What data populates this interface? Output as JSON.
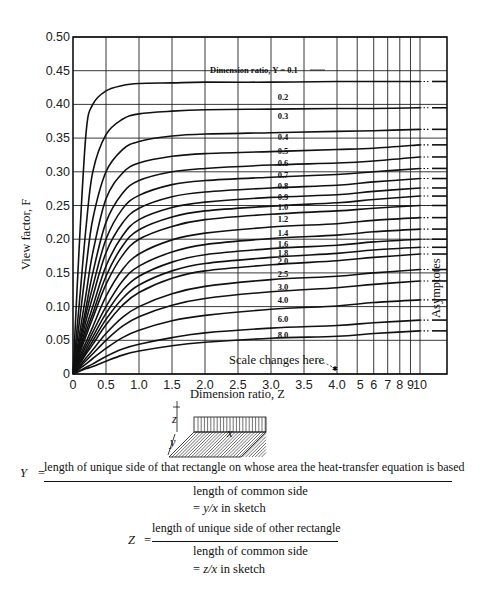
{
  "chart_data": {
    "type": "line",
    "title": "",
    "xlabel": "Dimension ratio, Z",
    "ylabel": "View factor, F",
    "ylim": [
      0,
      0.5
    ],
    "yticks": [
      "0",
      "0.05",
      "0.10",
      "0.15",
      "0.20",
      "0.25",
      "0.30",
      "0.35",
      "0.40",
      "0.45",
      "0.50"
    ],
    "xticks_linear": [
      "0",
      "0.5",
      "1.0",
      "1.5",
      "2.0",
      "2.5",
      "3.0",
      "3.5",
      "4.0"
    ],
    "xticks_log": [
      "5",
      "6",
      "7",
      "8",
      "9",
      "10"
    ],
    "grid": true,
    "legend_position": "inline labels",
    "legend_title": "Dimension ratio, Y = 0.1",
    "annotations": [
      "Scale changes here",
      "Asymptotes"
    ],
    "x": [
      0,
      0.1,
      0.2,
      0.3,
      0.5,
      0.75,
      1.0,
      1.5,
      2.0,
      3.0,
      4.0,
      6.0,
      10.0
    ],
    "series": [
      {
        "name": "0.1",
        "asymptote": 0.434,
        "values": [
          0,
          0.2,
          0.36,
          0.4,
          0.42,
          0.428,
          0.431,
          0.432,
          0.433,
          0.433,
          0.434,
          0.434,
          0.434
        ]
      },
      {
        "name": "0.2",
        "asymptote": 0.395,
        "values": [
          0,
          0.11,
          0.22,
          0.3,
          0.355,
          0.378,
          0.386,
          0.39,
          0.392,
          0.393,
          0.394,
          0.394,
          0.395
        ]
      },
      {
        "name": "0.3",
        "asymptote": 0.363,
        "values": [
          0,
          0.08,
          0.16,
          0.23,
          0.3,
          0.333,
          0.345,
          0.353,
          0.356,
          0.358,
          0.36,
          0.361,
          0.363
        ]
      },
      {
        "name": "0.4",
        "asymptote": 0.34,
        "values": [
          0,
          0.06,
          0.12,
          0.18,
          0.26,
          0.298,
          0.313,
          0.323,
          0.327,
          0.33,
          0.333,
          0.335,
          0.34
        ]
      },
      {
        "name": "0.5",
        "asymptote": 0.322,
        "values": [
          0,
          0.05,
          0.1,
          0.15,
          0.225,
          0.268,
          0.287,
          0.3,
          0.305,
          0.31,
          0.313,
          0.316,
          0.322
        ]
      },
      {
        "name": "0.6",
        "asymptote": 0.305,
        "values": [
          0,
          0.045,
          0.09,
          0.13,
          0.2,
          0.245,
          0.265,
          0.281,
          0.287,
          0.292,
          0.296,
          0.3,
          0.305
        ]
      },
      {
        "name": "0.7",
        "asymptote": 0.29,
        "values": [
          0,
          0.04,
          0.08,
          0.115,
          0.18,
          0.224,
          0.246,
          0.263,
          0.27,
          0.276,
          0.28,
          0.285,
          0.29
        ]
      },
      {
        "name": "0.8",
        "asymptote": 0.276,
        "values": [
          0,
          0.035,
          0.07,
          0.1,
          0.16,
          0.205,
          0.229,
          0.247,
          0.255,
          0.262,
          0.266,
          0.271,
          0.276
        ]
      },
      {
        "name": "0.9",
        "asymptote": 0.264,
        "values": [
          0,
          0.032,
          0.063,
          0.09,
          0.145,
          0.19,
          0.214,
          0.233,
          0.242,
          0.249,
          0.254,
          0.259,
          0.264
        ]
      },
      {
        "name": "1.0",
        "asymptote": 0.25,
        "values": [
          0,
          0.03,
          0.057,
          0.083,
          0.133,
          0.176,
          0.2,
          0.219,
          0.229,
          0.237,
          0.242,
          0.246,
          0.25
        ]
      },
      {
        "name": "1.2",
        "asymptote": 0.232,
        "values": [
          0,
          0.025,
          0.048,
          0.07,
          0.115,
          0.155,
          0.178,
          0.199,
          0.209,
          0.218,
          0.223,
          0.228,
          0.232
        ]
      },
      {
        "name": "1.4",
        "asymptote": 0.215,
        "values": [
          0,
          0.022,
          0.042,
          0.062,
          0.1,
          0.138,
          0.16,
          0.181,
          0.192,
          0.201,
          0.206,
          0.211,
          0.215
        ]
      },
      {
        "name": "1.6",
        "asymptote": 0.2,
        "values": [
          0,
          0.019,
          0.037,
          0.055,
          0.09,
          0.124,
          0.145,
          0.166,
          0.177,
          0.186,
          0.191,
          0.196,
          0.2
        ]
      },
      {
        "name": "1.8",
        "asymptote": 0.188,
        "values": [
          0,
          0.017,
          0.033,
          0.049,
          0.081,
          0.112,
          0.132,
          0.153,
          0.164,
          0.173,
          0.179,
          0.184,
          0.188
        ]
      },
      {
        "name": "2.0",
        "asymptote": 0.178,
        "values": [
          0,
          0.015,
          0.03,
          0.044,
          0.073,
          0.102,
          0.121,
          0.142,
          0.153,
          0.162,
          0.168,
          0.173,
          0.178
        ]
      },
      {
        "name": "2.5",
        "asymptote": 0.155,
        "values": [
          0,
          0.012,
          0.024,
          0.036,
          0.06,
          0.084,
          0.1,
          0.119,
          0.13,
          0.14,
          0.145,
          0.15,
          0.155
        ]
      },
      {
        "name": "3.0",
        "asymptote": 0.138,
        "values": [
          0,
          0.01,
          0.02,
          0.03,
          0.05,
          0.071,
          0.085,
          0.102,
          0.112,
          0.122,
          0.128,
          0.133,
          0.138
        ]
      },
      {
        "name": "4.0",
        "asymptote": 0.11,
        "values": [
          0,
          0.008,
          0.015,
          0.023,
          0.038,
          0.054,
          0.065,
          0.079,
          0.087,
          0.096,
          0.101,
          0.106,
          0.11
        ]
      },
      {
        "name": "6.0",
        "asymptote": 0.08,
        "values": [
          0,
          0.005,
          0.01,
          0.015,
          0.026,
          0.037,
          0.044,
          0.054,
          0.061,
          0.068,
          0.072,
          0.076,
          0.08
        ]
      },
      {
        "name": "8.0",
        "asymptote": 0.064,
        "values": [
          0,
          0.004,
          0.008,
          0.011,
          0.019,
          0.028,
          0.034,
          0.042,
          0.047,
          0.053,
          0.056,
          0.06,
          0.064
        ]
      }
    ]
  },
  "sketch": {
    "label_z": "z",
    "label_y": "y",
    "label_x": "x"
  },
  "equations": {
    "y_var": "Y",
    "y_eq": "=",
    "y_numerator": "length of unique side of that rectangle on whose area the heat-transfer equation is based",
    "y_denominator": "length of common side",
    "y_sketch_eq": "= ",
    "y_sketch_expr": "y/x",
    "y_sketch_tail": " in sketch",
    "z_var": "Z",
    "z_eq": "=",
    "z_numerator": "length of unique side of other rectangle",
    "z_denominator": "length of common side",
    "z_sketch_eq": "= ",
    "z_sketch_expr": "z/x",
    "z_sketch_tail": " in sketch"
  }
}
